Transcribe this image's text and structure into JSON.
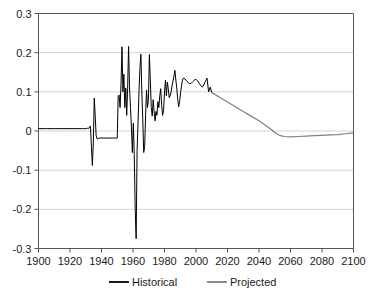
{
  "chart_data": {
    "type": "line",
    "title": "",
    "subtitle": "",
    "xlabel": "",
    "ylabel": "",
    "xlim": [
      1900,
      2100
    ],
    "ylim": [
      -0.3,
      0.3
    ],
    "grid": true,
    "legend_position": "bottom-center",
    "x_ticks": [
      1900,
      1920,
      1940,
      1960,
      1980,
      2000,
      2020,
      2040,
      2060,
      2080,
      2100
    ],
    "x_tick_labels": [
      "1900",
      "1920",
      "1940",
      "1960",
      "1980",
      "2000",
      "2020",
      "2040",
      "2060",
      "2080",
      "2100"
    ],
    "y_ticks": [
      0.3,
      0.2,
      0.1,
      0,
      -0.1,
      -0.2,
      -0.3
    ],
    "y_tick_labels": [
      "0.3",
      "0.2",
      "0.1",
      "0",
      "-0.1",
      "-0.2",
      "-0.3"
    ],
    "colors": {
      "historical": "#000000",
      "projected": "#808080",
      "axis": "#555555",
      "grid": "#c8c8c8",
      "background": "#ffffff"
    },
    "series": [
      {
        "name": "Historical",
        "color": "#000000",
        "x": [
          1900,
          1905,
          1910,
          1915,
          1920,
          1925,
          1928,
          1930,
          1931,
          1932,
          1933,
          1933.6,
          1934.2,
          1934.8,
          1935.4,
          1936,
          1936.6,
          1937.2,
          1938,
          1939,
          1941,
          1943,
          1945,
          1947,
          1949,
          1950,
          1950.6,
          1951.2,
          1951.8,
          1952.4,
          1953,
          1953.6,
          1954.2,
          1954.8,
          1955.4,
          1956,
          1956.6,
          1957.2,
          1957.8,
          1958.4,
          1959,
          1959.6,
          1960.2,
          1960.8,
          1961.4,
          1962,
          1962.6,
          1963.2,
          1963.8,
          1964.4,
          1965,
          1965.6,
          1966.2,
          1966.8,
          1967.4,
          1968,
          1968.6,
          1969.2,
          1969.8,
          1970.4,
          1971,
          1971.6,
          1972.2,
          1972.8,
          1973.4,
          1974,
          1974.6,
          1975.2,
          1975.8,
          1976.4,
          1977,
          1977.6,
          1978.2,
          1978.8,
          1979.4,
          1980,
          1980.6,
          1981.2,
          1981.8,
          1982.4,
          1983,
          1983.6,
          1984.2,
          1984.8,
          1985.4,
          1986,
          1986.6,
          1987.2,
          1987.8,
          1988.4,
          1989,
          1989.6,
          1990.2,
          1990.8,
          1991.4,
          1992,
          1993,
          1994,
          1995,
          1996,
          1997,
          1998,
          1999,
          2000,
          2001,
          2002,
          2003,
          2004,
          2005,
          2006,
          2007,
          2008,
          2009,
          2010
        ],
        "y": [
          0.006,
          0.006,
          0.006,
          0.006,
          0.006,
          0.006,
          0.006,
          0.006,
          0.007,
          0.007,
          0.013,
          -0.04,
          -0.088,
          -0.03,
          0.084,
          0.04,
          -0.012,
          -0.02,
          -0.019,
          -0.018,
          -0.018,
          -0.018,
          -0.018,
          -0.018,
          -0.018,
          -0.018,
          0.09,
          0.092,
          0.06,
          0.12,
          0.215,
          0.1,
          0.145,
          0.06,
          0.11,
          0.04,
          0.108,
          0.216,
          0.11,
          0.06,
          0.01,
          -0.055,
          0.02,
          -0.06,
          -0.2,
          -0.275,
          -0.05,
          0.02,
          0.1,
          0.16,
          0.196,
          0.1,
          0.03,
          -0.055,
          -0.04,
          0.04,
          0.105,
          0.06,
          0.08,
          0.195,
          0.13,
          0.06,
          0.038,
          0.08,
          0.05,
          0.026,
          0.05,
          0.04,
          0.075,
          0.06,
          0.09,
          0.108,
          0.065,
          0.04,
          0.052,
          0.1,
          0.13,
          0.09,
          0.125,
          0.108,
          0.085,
          0.09,
          0.1,
          0.115,
          0.128,
          0.14,
          0.155,
          0.13,
          0.11,
          0.08,
          0.062,
          0.075,
          0.098,
          0.115,
          0.13,
          0.135,
          0.133,
          0.128,
          0.124,
          0.12,
          0.122,
          0.126,
          0.13,
          0.132,
          0.128,
          0.122,
          0.116,
          0.112,
          0.118,
          0.127,
          0.135,
          0.1,
          0.112,
          0.098
        ]
      },
      {
        "name": "Projected",
        "color": "#808080",
        "x": [
          2010,
          2015,
          2020,
          2025,
          2030,
          2035,
          2040,
          2045,
          2048,
          2050,
          2053,
          2056,
          2060,
          2065,
          2070,
          2075,
          2080,
          2085,
          2090,
          2095,
          2100
        ],
        "y": [
          0.098,
          0.086,
          0.074,
          0.062,
          0.05,
          0.038,
          0.026,
          0.012,
          0.003,
          -0.004,
          -0.011,
          -0.014,
          -0.015,
          -0.014,
          -0.013,
          -0.012,
          -0.011,
          -0.01,
          -0.009,
          -0.007,
          -0.005
        ]
      }
    ],
    "legend": [
      {
        "label": "Historical",
        "color": "#000000"
      },
      {
        "label": "Projected",
        "color": "#808080"
      }
    ]
  }
}
